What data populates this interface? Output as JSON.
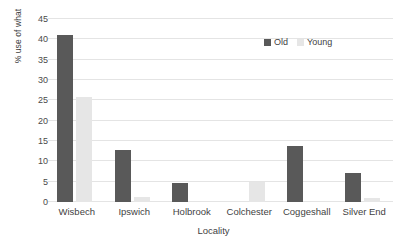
{
  "chart_data": {
    "type": "bar",
    "title": "",
    "xlabel": "Locality",
    "ylabel": "% use of what",
    "categories": [
      "Wisbech",
      "Ipswich",
      "Holbrook",
      "Colchester",
      "Coggeshall",
      "Silver End"
    ],
    "series": [
      {
        "name": "Old",
        "color": "#595959",
        "values": [
          41,
          12.8,
          4.7,
          0,
          13.8,
          7.2
        ]
      },
      {
        "name": "Young",
        "color": "#e6e6e6",
        "values": [
          25.9,
          1.2,
          0,
          4.8,
          0,
          1.0
        ]
      }
    ],
    "ylim": [
      0,
      45
    ],
    "ytick_step": 5,
    "yticks": [
      45,
      40,
      35,
      30,
      25,
      20,
      15,
      10,
      5,
      0
    ],
    "grid": true,
    "grid_axis": "y",
    "legend_position": "top-right",
    "legend_entries": [
      "Old",
      "Young"
    ]
  }
}
